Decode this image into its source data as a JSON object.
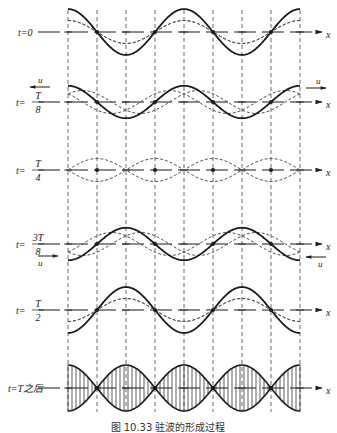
{
  "figure": {
    "caption": "图 10.33   驻波的形成过程",
    "axis_label": "x",
    "velocity_label": "u",
    "rows": [
      {
        "id": "t0",
        "label_prefix": "t=",
        "label_value": "0",
        "fraction": false,
        "phase_eighths": 0,
        "show_u": false
      },
      {
        "id": "t1",
        "label_prefix": "t=",
        "label_num": "T",
        "label_den": "8",
        "fraction": true,
        "phase_eighths": 1,
        "show_u": true
      },
      {
        "id": "t2",
        "label_prefix": "t=",
        "label_num": "T",
        "label_den": "4",
        "fraction": true,
        "phase_eighths": 2,
        "show_u": false
      },
      {
        "id": "t3",
        "label_prefix": "t=",
        "label_num": "3T",
        "label_den": "8",
        "fraction": true,
        "phase_eighths": 3,
        "show_u": true
      },
      {
        "id": "t4",
        "label_prefix": "t=",
        "label_num": "T",
        "label_den": "2",
        "fraction": true,
        "phase_eighths": 4,
        "show_u": false
      },
      {
        "id": "t5",
        "label_prefix": "t=",
        "label_value": "T之后",
        "fraction": false,
        "envelope": true,
        "show_u": false
      }
    ],
    "wavelengths_shown": 2,
    "colors": {
      "line": "#1a1a1a",
      "dashed": "#555555"
    }
  }
}
